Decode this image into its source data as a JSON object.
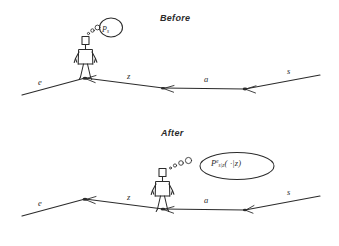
{
  "figure": {
    "type": "hand-drawn-diagram",
    "ink_color": "#2b2b2b",
    "background_color": "#ffffff",
    "panels": [
      {
        "id": "before",
        "title": "Before",
        "segment_labels": [
          "e",
          "z",
          "a",
          "s"
        ],
        "bubble": {
          "symbol": "P",
          "subscript": "s"
        }
      },
      {
        "id": "after",
        "title": "After",
        "segment_labels": [
          "e",
          "z",
          "a",
          "s"
        ],
        "bubble": {
          "symbol": "P",
          "superscript": "e",
          "subscript": "s|z",
          "argument": "( ·|z)"
        }
      }
    ]
  },
  "panel_before": {
    "title": "Before",
    "labels": {
      "e": "e",
      "z": "z",
      "a": "a",
      "s": "s"
    },
    "bubble": {
      "p": "P",
      "sub": "s"
    }
  },
  "panel_after": {
    "title": "After",
    "labels": {
      "e": "e",
      "z": "z",
      "a": "a",
      "s": "s"
    },
    "bubble": {
      "p": "P",
      "sup": "e",
      "sub": "s|z",
      "arg": "( ·|z)"
    }
  }
}
